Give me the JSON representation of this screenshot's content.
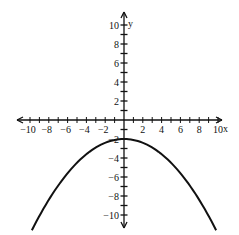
{
  "chart_data": {
    "type": "line",
    "title": "",
    "xlabel": "x",
    "ylabel": "y",
    "xlim": [
      -11,
      11
    ],
    "ylim": [
      -11,
      11
    ],
    "x_tick_labels": [
      "-10",
      "-8",
      "-6",
      "-4",
      "-2",
      "2",
      "4",
      "6",
      "8",
      "10"
    ],
    "y_tick_labels": [
      "10",
      "8",
      "6",
      "4",
      "2",
      "-2",
      "-4",
      "-6",
      "-8",
      "-10"
    ],
    "x_minor_ticks": [
      -10,
      -9,
      -8,
      -7,
      -6,
      -5,
      -4,
      -3,
      -2,
      -1,
      1,
      2,
      3,
      4,
      5,
      6,
      7,
      8,
      9,
      10
    ],
    "y_minor_ticks": [
      -10,
      -9,
      -8,
      -7,
      -6,
      -5,
      -4,
      -3,
      -2,
      -1,
      1,
      2,
      3,
      4,
      5,
      6,
      7,
      8,
      9,
      10
    ],
    "grid": false,
    "legend": null,
    "series": [
      {
        "name": "parabola",
        "equation": "y = -0.1x^2 - 2",
        "x": [
          -9.8,
          -8,
          -6,
          -4,
          -2,
          0,
          2,
          4,
          6,
          8,
          9.8
        ],
        "y": [
          -11.6,
          -8.4,
          -5.6,
          -3.6,
          -2.4,
          -2,
          -2.4,
          -3.6,
          -5.6,
          -8.4,
          -11.6
        ]
      }
    ],
    "axis_arrows": true
  }
}
